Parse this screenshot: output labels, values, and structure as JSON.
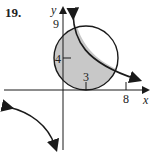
{
  "problem": {
    "number": "19."
  },
  "axes": {
    "x_label": "x",
    "y_label": "y"
  },
  "ticks": {
    "y9": "9",
    "y4": "4",
    "x3": "3",
    "x8": "8"
  },
  "colors": {
    "shade": "#c8c8c8",
    "stroke": "#1a1a1a"
  },
  "figure": {
    "circle": {
      "center": [
        3,
        4
      ],
      "radius": 5
    },
    "curve": "hyperbola branches with arrows",
    "shaded_region": "inside circle, below/left of hyperbola branch"
  }
}
